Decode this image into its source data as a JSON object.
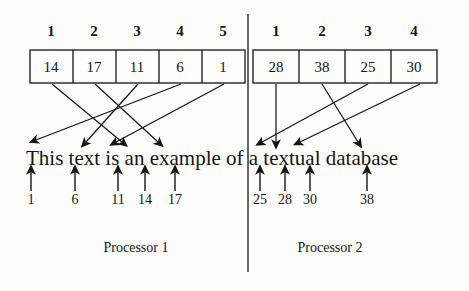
{
  "figure": {
    "ink_color": "#151515",
    "background_color": "#fdfdfb"
  },
  "processors": [
    {
      "name": "Processor 1",
      "label_x": 136,
      "label_y": 248,
      "index_table": {
        "x": 30,
        "y": 50,
        "cell_width": 43,
        "height": 33,
        "column_headers": [
          "1",
          "2",
          "3",
          "4",
          "5"
        ],
        "values": [
          "14",
          "17",
          "11",
          "6",
          "1"
        ]
      },
      "position_markers": [
        {
          "label": "1",
          "x": 31
        },
        {
          "label": "6",
          "x": 75
        },
        {
          "label": "11",
          "x": 118
        },
        {
          "label": "14",
          "x": 145
        },
        {
          "label": "17",
          "x": 175
        }
      ],
      "mappings": [
        {
          "from_cell": 0,
          "to_position": 3
        },
        {
          "from_cell": 1,
          "to_position": 4
        },
        {
          "from_cell": 2,
          "to_position": 2
        },
        {
          "from_cell": 3,
          "to_position": 1
        },
        {
          "from_cell": 4,
          "to_position": 0
        }
      ]
    },
    {
      "name": "Processor 2",
      "label_x": 330,
      "label_y": 248,
      "index_table": {
        "x": 253,
        "y": 50,
        "cell_width": 46,
        "height": 33,
        "column_headers": [
          "1",
          "2",
          "3",
          "4"
        ],
        "values": [
          "28",
          "38",
          "25",
          "30"
        ]
      },
      "position_markers": [
        {
          "label": "25",
          "x": 260
        },
        {
          "label": "28",
          "x": 285
        },
        {
          "label": "30",
          "x": 310
        },
        {
          "label": "38",
          "x": 367
        }
      ],
      "mappings": [
        {
          "from_cell": 0,
          "to_position": 1
        },
        {
          "from_cell": 1,
          "to_position": 3
        },
        {
          "from_cell": 2,
          "to_position": 0
        },
        {
          "from_cell": 3,
          "to_position": 2
        }
      ]
    }
  ],
  "text_line": {
    "content": "This text is an example of a textual database",
    "x": 26,
    "y": 163
  },
  "divider": {
    "x": 248,
    "y_top": 14,
    "y_bottom": 272
  }
}
